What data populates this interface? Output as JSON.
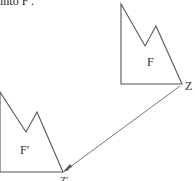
{
  "caption": "into F′.",
  "figure": {
    "original": {
      "label": "F",
      "points": [
        [
          121,
          4
        ],
        [
          145,
          46
        ],
        [
          156,
          26
        ],
        [
          182,
          84
        ],
        [
          121,
          84
        ]
      ],
      "label_pos": [
        147,
        62
      ]
    },
    "image": {
      "label": "F′",
      "points": [
        [
          0,
          92
        ],
        [
          26,
          132
        ],
        [
          37,
          112
        ],
        [
          63,
          172
        ],
        [
          0,
          172
        ]
      ],
      "label_pos": [
        20,
        150
      ]
    },
    "center_point": {
      "label": "Z",
      "pos": [
        182,
        84
      ]
    },
    "image_point": {
      "label": "Z′",
      "pos": [
        63,
        172
      ]
    },
    "arrow": {
      "from": [
        182,
        84
      ],
      "to": [
        64,
        171
      ]
    },
    "stroke_color": "#555555"
  }
}
